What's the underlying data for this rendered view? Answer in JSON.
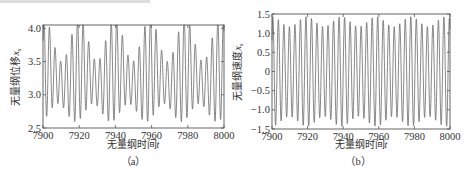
{
  "chart_data": [
    {
      "id": "a",
      "type": "line",
      "caption": "（a）",
      "title": "",
      "xlabel": "无量纲时间t",
      "xlabel_main": "无量纲时间",
      "xlabel_var": "t",
      "ylabel": "无量纲位移x_s",
      "ylabel_main": "无量纲位移",
      "ylabel_var": "x",
      "ylabel_sub": "s",
      "xlim": [
        7900,
        8000
      ],
      "ylim": [
        2.5,
        4.05
      ],
      "xticks": [
        7900,
        7920,
        7940,
        7960,
        7980,
        8000
      ],
      "xtick_labels": [
        "7900",
        "7920",
        "7940",
        "7960",
        "7980",
        "8000"
      ],
      "yticks": [
        2.5,
        3.0,
        3.5,
        4.0
      ],
      "ytick_labels": [
        "2.5",
        "3.0",
        "3.5",
        "4.0"
      ],
      "grid": false,
      "legend": null,
      "series": [
        {
          "name": "displacement",
          "color": "#6a6a6a",
          "description": "quasi-periodic oscillation, ~32 cycles per 100 time units, beating envelope with period ~19.5",
          "model": {
            "mean": 3.28,
            "carrier_period": 3.1,
            "amp_base": 0.55,
            "amp_mod": 0.22,
            "mod_period": 19.5,
            "offset_mod": 0.12
          },
          "approx_peaks_max": [
            3.8,
            3.95,
            4.05,
            4.05,
            3.85,
            3.8,
            3.75,
            3.85,
            3.95,
            4.05,
            4.05,
            4.0,
            3.95,
            3.8,
            3.75
          ],
          "approx_troughs_min": [
            2.7,
            2.95,
            2.6,
            2.55,
            2.7,
            3.0,
            3.05,
            2.8,
            2.6,
            2.55,
            2.9,
            3.05,
            2.8,
            2.55,
            2.6
          ]
        }
      ]
    },
    {
      "id": "b",
      "type": "line",
      "caption": "（b）",
      "title": "",
      "xlabel": "无量纲时间t",
      "xlabel_main": "无量纲时间",
      "xlabel_var": "t",
      "ylabel": "无量纲速度x_s",
      "ylabel_main": "无量纲速度",
      "ylabel_var": "x",
      "ylabel_sub": "s",
      "xlim": [
        7900,
        8000
      ],
      "ylim": [
        -1.5,
        1.5
      ],
      "xticks": [
        7900,
        7920,
        7940,
        7960,
        7980,
        8000
      ],
      "xtick_labels": [
        "7900",
        "7920",
        "7940",
        "7960",
        "7980",
        "8000"
      ],
      "yticks": [
        -1.5,
        -1.0,
        -0.5,
        0,
        0.5,
        1.0,
        1.5
      ],
      "ytick_labels": [
        "−1.5",
        "−1.0",
        "−0.5",
        "0",
        "0.5",
        "1.0",
        "1.5"
      ],
      "grid": false,
      "legend": null,
      "series": [
        {
          "name": "velocity",
          "color": "#6a6a6a",
          "description": "oscillation between about ±1.2 and ±1.45 with beating envelope, ~32 cycles per 100 time units",
          "model": {
            "mean": 0.0,
            "carrier_period": 3.1,
            "amp_base": 1.3,
            "amp_mod": 0.13,
            "mod_period": 19.5,
            "offset_mod": 0.0
          },
          "approx_peak_range": [
            1.2,
            1.45
          ],
          "approx_trough_range": [
            -1.45,
            -1.2
          ]
        }
      ]
    }
  ],
  "layout": {
    "panels": [
      {
        "left": 43,
        "top": 25,
        "width": 181,
        "height": 103
      },
      {
        "left": 272,
        "top": 14,
        "width": 178,
        "height": 115
      }
    ]
  }
}
